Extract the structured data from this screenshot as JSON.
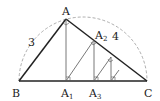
{
  "labels": {
    "A": "A",
    "B": "B",
    "C": "C",
    "A1": "A",
    "A1_sub": "1",
    "A2": "A",
    "A2_sub": "2",
    "A3": "A",
    "A3_sub": "3",
    "side_AB": "3",
    "side_AC": "4"
  },
  "colors": {
    "main": "#222222",
    "thin": "#555555",
    "arc": "#999999"
  }
}
